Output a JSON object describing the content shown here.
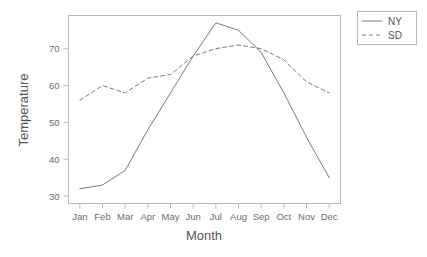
{
  "chart_data": {
    "type": "line",
    "title": "",
    "xlabel": "Month",
    "ylabel": "Temperature",
    "categories": [
      "Jan",
      "Feb",
      "Mar",
      "Apr",
      "May",
      "Jun",
      "Jul",
      "Aug",
      "Sep",
      "Oct",
      "Nov",
      "Dec"
    ],
    "series": [
      {
        "name": "NY",
        "style": "solid",
        "color": "#7a7a7a",
        "values": [
          32,
          33,
          37,
          48,
          58,
          68,
          77,
          75,
          69,
          58,
          46,
          35
        ]
      },
      {
        "name": "SD",
        "style": "dashed",
        "color": "#7a7a7a",
        "values": [
          56,
          60,
          58,
          62,
          63,
          68,
          70,
          71,
          70,
          67,
          61,
          58
        ]
      }
    ],
    "yticks": [
      30,
      40,
      50,
      60,
      70
    ],
    "ylim": [
      28,
      79
    ],
    "xlim": [
      0.5,
      12.5
    ],
    "grid": false,
    "legend": {
      "position": "right",
      "entries": [
        "NY",
        "SD"
      ]
    }
  }
}
